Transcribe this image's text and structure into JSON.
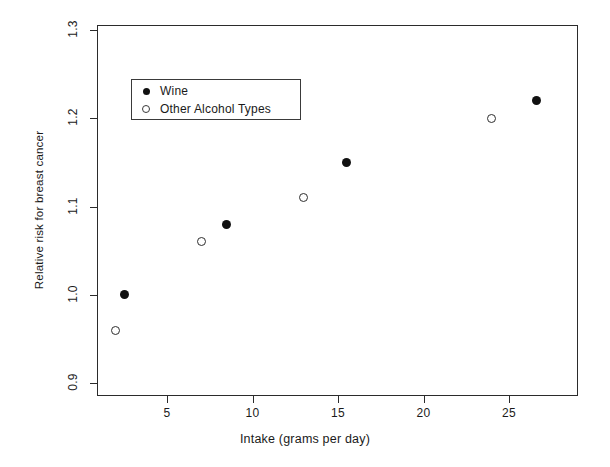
{
  "chart_data": {
    "type": "scatter",
    "title": "",
    "xlabel": "Intake (grams per day)",
    "ylabel": "Relative risk for breast cancer",
    "xlim": [
      0.9,
      29.0
    ],
    "ylim": [
      0.88,
      1.31
    ],
    "xticks": [
      5,
      10,
      15,
      20,
      25
    ],
    "xticklabels": [
      "5",
      "10",
      "15",
      "20",
      "25"
    ],
    "yticks": [
      0.9,
      1.0,
      1.1,
      1.2,
      1.3
    ],
    "yticklabels": [
      "0.9",
      "1.0",
      "1.1",
      "1.2",
      "1.3"
    ],
    "grid": false,
    "legend_position": "upper left",
    "series": [
      {
        "name": "Wine",
        "marker": "filled-circle",
        "color": "#111111",
        "points": [
          {
            "x": 2.5,
            "y": 1.0
          },
          {
            "x": 8.5,
            "y": 1.08
          },
          {
            "x": 15.5,
            "y": 1.15
          },
          {
            "x": 26.6,
            "y": 1.22
          }
        ]
      },
      {
        "name": "Other Alcohol Types",
        "marker": "open-circle",
        "color": "#2e2e2e",
        "points": [
          {
            "x": 2.0,
            "y": 0.96
          },
          {
            "x": 7.0,
            "y": 1.06
          },
          {
            "x": 13.0,
            "y": 1.11
          },
          {
            "x": 24.0,
            "y": 1.2
          }
        ]
      }
    ]
  },
  "legend": {
    "items": [
      {
        "label": "Wine",
        "marker": "filled-circle"
      },
      {
        "label": "Other Alcohol Types",
        "marker": "open-circle"
      }
    ]
  },
  "colors": {
    "background": "#ffffff",
    "axis": "#2b2b2b",
    "text": "#1a1a1a"
  }
}
